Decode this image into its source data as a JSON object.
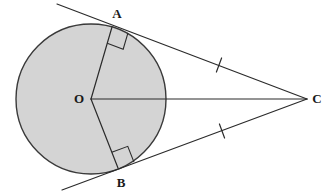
{
  "figure": {
    "type": "geometry-diagram",
    "background_color": "#ffffff",
    "stroke_color": "#2b2b2b",
    "circle_fill_color": "#d4d4d4",
    "circle_stroke_color": "#3a3a3a"
  },
  "circle": {
    "name": "circle-O",
    "center_x": 91,
    "center_y": 99,
    "radius": 75,
    "fill": "#d4d4d4",
    "stroke": "#3a3a3a",
    "stroke_width": 1.4
  },
  "points": {
    "O": {
      "label": "O",
      "x": 91,
      "y": 99,
      "label_x": 79,
      "label_y": 103
    },
    "A": {
      "label": "A",
      "x": 112,
      "y": 27,
      "label_x": 117,
      "label_y": 18
    },
    "B": {
      "label": "B",
      "x": 118,
      "y": 168,
      "label_x": 121,
      "label_y": 187
    },
    "C": {
      "label": "C",
      "x": 307,
      "y": 99,
      "label_x": 317,
      "label_y": 103
    }
  },
  "segments": [
    {
      "name": "radius-OA",
      "x1": 91,
      "y1": 99,
      "x2": 112,
      "y2": 27,
      "stroke_width": 1.2
    },
    {
      "name": "radius-OB",
      "x1": 91,
      "y1": 99,
      "x2": 118,
      "y2": 168,
      "stroke_width": 1.2
    },
    {
      "name": "segment-OC",
      "x1": 91,
      "y1": 99,
      "x2": 307,
      "y2": 99,
      "stroke_width": 1.2
    },
    {
      "name": "tangent-line-upper",
      "x1": 57,
      "y1": 4,
      "x2": 307,
      "y2": 99,
      "stroke_width": 1.2
    },
    {
      "name": "tangent-line-lower",
      "x1": 62,
      "y1": 190,
      "x2": 307,
      "y2": 99,
      "stroke_width": 1.2
    }
  ],
  "right_angle_markers": [
    {
      "name": "right-angle-at-A",
      "vertex_x": 112,
      "vertex_y": 27,
      "size": 17
    },
    {
      "name": "right-angle-at-B",
      "vertex_x": 118,
      "vertex_y": 168,
      "size": 17
    }
  ],
  "congruence_ticks": [
    {
      "name": "tick-mark-upper-tangent",
      "cx": 219,
      "cy": 65,
      "length": 15
    },
    {
      "name": "tick-mark-lower-tangent",
      "cx": 222,
      "cy": 131,
      "length": 15
    }
  ],
  "annotations": {
    "description": "Circle centered at O with tangent segments CA and CB drawn from external point C. Radii OA and OB meet the tangents at right angles. Single tick marks indicate CA = CB."
  }
}
